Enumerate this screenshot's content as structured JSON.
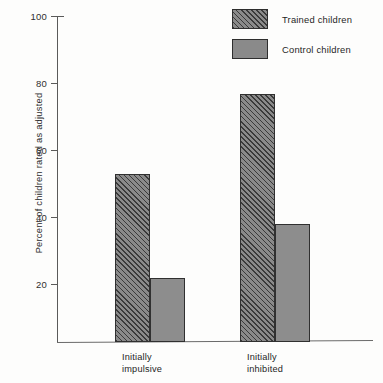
{
  "chart_data": {
    "type": "bar",
    "title": "",
    "xlabel": "",
    "ylabel": "Percent of children rated as adjusted",
    "ylim": [
      0,
      100
    ],
    "yticks": [
      20,
      40,
      60,
      80,
      100
    ],
    "ytick_labels": [
      "20",
      "40",
      "60",
      "80",
      "100"
    ],
    "grid": false,
    "legend_position": "top-right",
    "categories": [
      "Initially impulsive",
      "Initially inhibited"
    ],
    "category_lines": [
      [
        "Initially",
        "impulsive"
      ],
      [
        "Initially",
        "inhibited"
      ]
    ],
    "series": [
      {
        "name": "Trained children",
        "values": [
          53,
          77
        ],
        "fill": "hatched",
        "color": "#8a8a8a"
      },
      {
        "name": "Control children",
        "values": [
          22,
          38
        ],
        "fill": "solid",
        "color": "#8d8d8d"
      }
    ]
  },
  "legend": {
    "items": [
      {
        "label": "Trained children",
        "fill": "hatched"
      },
      {
        "label": "Control children",
        "fill": "solid"
      }
    ]
  },
  "colors": {
    "bar_fill": "#8a8a8a",
    "bar_border": "#303030",
    "axis": "#5a5a5a",
    "text": "#242424",
    "background": "#fdfdfc"
  }
}
